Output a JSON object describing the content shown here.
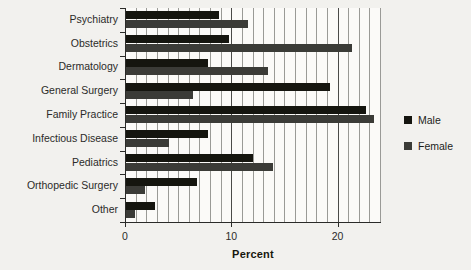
{
  "chart_data": {
    "type": "bar",
    "orientation": "horizontal",
    "title": "",
    "xlabel": "Percent",
    "ylabel": "",
    "xlim": [
      0,
      24
    ],
    "xticks": [
      0,
      10,
      20
    ],
    "grid": true,
    "legend_position": "right",
    "categories": [
      "Psychiatry",
      "Obstetrics",
      "Dermatology",
      "General Surgery",
      "Family Practice",
      "Infectious Disease",
      "Pediatrics",
      "Orthopedic Surgery",
      "Other"
    ],
    "series": [
      {
        "name": "Male",
        "color": "#15150f",
        "values": [
          8.8,
          9.8,
          7.8,
          19.3,
          22.7,
          7.8,
          12.0,
          6.8,
          2.8
        ]
      },
      {
        "name": "Female",
        "color": "#3b3b37",
        "values": [
          11.6,
          21.4,
          13.5,
          6.4,
          23.4,
          4.1,
          13.9,
          1.9,
          0.9
        ]
      }
    ]
  },
  "legend": {
    "items": [
      {
        "label": "Male"
      },
      {
        "label": "Female"
      }
    ]
  },
  "axis": {
    "x_title": "Percent",
    "tick_labels": [
      "0",
      "10",
      "20"
    ]
  }
}
